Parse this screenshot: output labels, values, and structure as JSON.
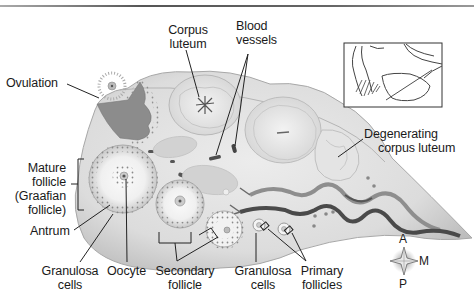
{
  "figure": {
    "labels": {
      "ovulation": "Ovulation",
      "corpus_luteum": [
        "Corpus",
        "luteum"
      ],
      "blood_vessels": [
        "Blood",
        "vessels"
      ],
      "degenerating_corpus_luteum": [
        "Degenerating",
        "corpus luteum"
      ],
      "mature_follicle": [
        "Mature",
        "follicle",
        "(Graafian",
        "follicle)"
      ],
      "antrum": "Antrum",
      "granulosa_cells_left": [
        "Granulosa",
        "cells"
      ],
      "oocyte": "Oocyte",
      "secondary_follicle": [
        "Secondary",
        "follicle"
      ],
      "granulosa_cells_right": [
        "Granulosa",
        "cells"
      ],
      "primary_follicles": [
        "Primary",
        "follicles"
      ]
    },
    "compass": {
      "anterior": "A",
      "medial": "M",
      "posterior": "P"
    },
    "inset": "Locator diagram of ovary, uterine tube and fimbriae"
  }
}
